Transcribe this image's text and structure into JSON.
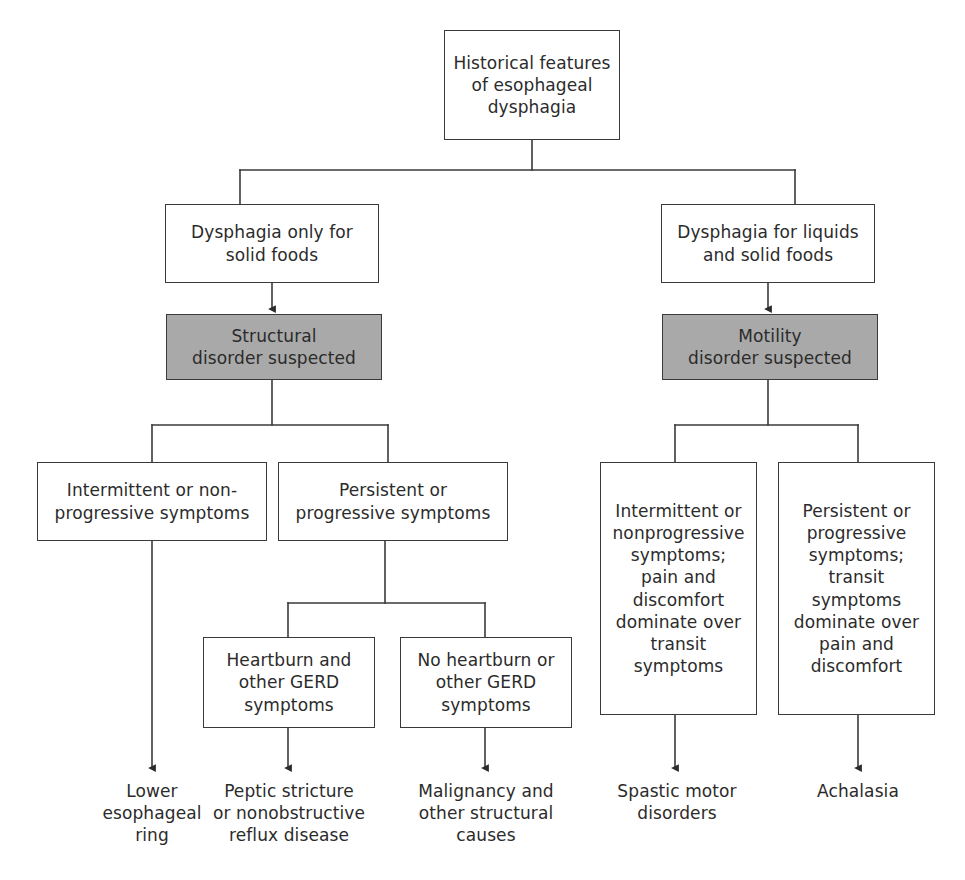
{
  "diagram": {
    "title": "Historical features of esophageal dysphagia",
    "type": "clinical-decision-flowchart",
    "colors": {
      "background": "#ffffff",
      "box_border": "#3a3a3a",
      "box_fill": "#ffffff",
      "shaded_fill": "#a9a9a9",
      "text": "#2b2b2b",
      "connector": "#3a3a3a"
    },
    "nodes": {
      "root": {
        "label": "Historical features\nof esophageal\ndysphagia",
        "style": "boxed"
      },
      "solid_only": {
        "label": "Dysphagia only for\nsolid foods",
        "style": "boxed"
      },
      "liquids_and_solids": {
        "label": "Dysphagia for liquids\nand solid foods",
        "style": "boxed"
      },
      "structural_disorder": {
        "label": "Structural\ndisorder suspected",
        "style": "shaded"
      },
      "motility_disorder": {
        "label": "Motility\ndisorder suspected",
        "style": "shaded"
      },
      "intermittent_nonprogressive": {
        "label": "Intermittent or non-\nprogressive symptoms",
        "style": "boxed"
      },
      "persistent_progressive": {
        "label": "Persistent or\nprogressive symptoms",
        "style": "boxed"
      },
      "heartburn_gerd": {
        "label": "Heartburn and\nother GERD\nsymptoms",
        "style": "boxed"
      },
      "no_heartburn_gerd": {
        "label": "No heartburn or\nother GERD\nsymptoms",
        "style": "boxed"
      },
      "motility_intermittent": {
        "label": "Intermittent or\nnonprogressive\nsymptoms;\npain and\ndiscomfort\ndominate over\ntransit\nsymptoms",
        "style": "boxed"
      },
      "motility_persistent": {
        "label": "Persistent or\nprogressive\nsymptoms;\ntransit\nsymptoms\ndominate over\npain and\ndiscomfort",
        "style": "boxed"
      },
      "lower_esophageal_ring": {
        "label": "Lower\nesophageal\nring",
        "style": "plain"
      },
      "peptic_stricture": {
        "label": "Peptic stricture\nor nonobstructive\nreflux disease",
        "style": "plain"
      },
      "malignancy": {
        "label": "Malignancy and\nother structural\ncauses",
        "style": "plain"
      },
      "spastic_motor_disorders": {
        "label": "Spastic motor\ndisorders",
        "style": "plain"
      },
      "achalasia": {
        "label": "Achalasia",
        "style": "plain"
      }
    }
  }
}
